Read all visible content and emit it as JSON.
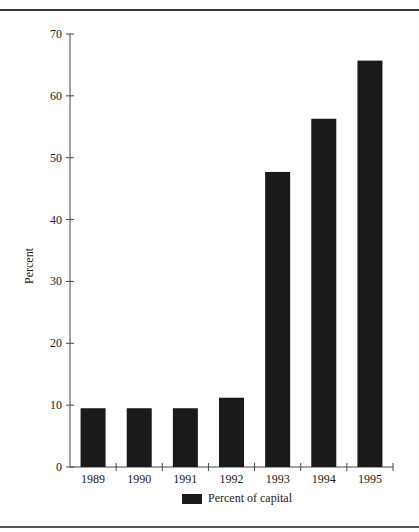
{
  "chart_data": {
    "type": "bar",
    "title": "",
    "xlabel": "",
    "ylabel": "Percent",
    "ylim": [
      0,
      70
    ],
    "yticks": [
      0,
      10,
      20,
      30,
      40,
      50,
      60,
      70
    ],
    "categories": [
      "1989",
      "1990",
      "1991",
      "1992",
      "1993",
      "1994",
      "1995"
    ],
    "series": [
      {
        "name": "Percent of capital",
        "color": "#1a1a1a",
        "values": [
          9.5,
          9.5,
          9.5,
          11.2,
          47.7,
          56.3,
          65.7
        ]
      }
    ],
    "legend_position": "bottom",
    "grid": false
  },
  "axis": {
    "ylabel": "Percent"
  },
  "legend": {
    "label": "Percent of capital"
  }
}
